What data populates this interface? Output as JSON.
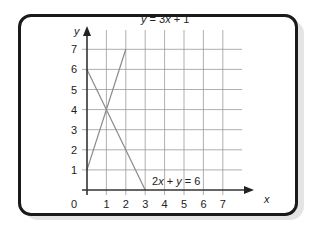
{
  "diagram": {
    "axes": {
      "x_label": "x",
      "y_label": "y",
      "origin_label": "0",
      "x_ticks": [
        "1",
        "2",
        "3",
        "4",
        "5",
        "6",
        "7"
      ],
      "y_ticks": [
        "1",
        "2",
        "3",
        "4",
        "5",
        "6",
        "7"
      ]
    },
    "lines": [
      {
        "name": "y = 3x + 1",
        "label_parts": [
          "y",
          " = 3",
          "x",
          " + 1"
        ],
        "points": [
          [
            0,
            1
          ],
          [
            2,
            7
          ]
        ]
      },
      {
        "name": "2x + y = 6",
        "label_parts": [
          "2",
          "x",
          " + ",
          "y",
          " = 6"
        ],
        "points": [
          [
            0,
            6
          ],
          [
            3,
            0
          ]
        ]
      }
    ],
    "intersection": [
      1,
      4
    ],
    "colors": {
      "grid": "#9a9a9a",
      "axis": "#222222",
      "line": "#8a8a8a",
      "border": "#1a1a1a"
    }
  }
}
